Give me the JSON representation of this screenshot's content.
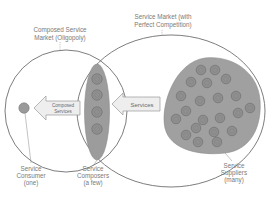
{
  "diagram": {
    "title_left": [
      "Composed Service",
      "Market (Oligopoly)"
    ],
    "title_right": [
      "Service Market (with",
      "Perfect Competition)"
    ],
    "arrow_left_label": [
      "Composed",
      "Services"
    ],
    "arrow_right_label": "Services",
    "consumer_label": [
      "Service",
      "Consumer",
      "(one)"
    ],
    "composers_label": [
      "Service",
      "Composers",
      "(a few)"
    ],
    "suppliers_label": [
      "Service",
      "Suppliers",
      "(many)"
    ],
    "composer_count": 4,
    "supplier_count": 21,
    "colors": {
      "line": "#6e6e6e",
      "blob_fill": "#9c9c9c",
      "node_fill": "#8f8f8f",
      "node_stroke": "#6a6a6a",
      "arrow_fill": "#ededed",
      "text": "#7a7a7a"
    }
  }
}
